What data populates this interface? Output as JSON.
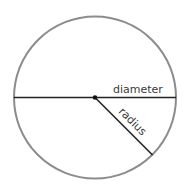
{
  "diagram": {
    "labels": {
      "diameter": "diameter",
      "radius": "radius"
    },
    "colors": {
      "circle_stroke": "#8c8c8c",
      "line_stroke": "#222222",
      "center_dot": "#111111",
      "text": "#3a3a3a"
    }
  }
}
